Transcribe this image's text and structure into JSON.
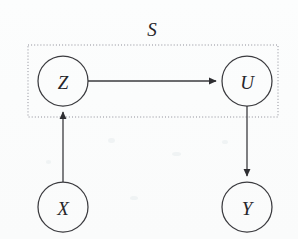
{
  "figure": {
    "type": "directed-acyclic-graph",
    "background_color": "#fdfdfd",
    "stroke_color": "#3b3b3f",
    "plate_stroke_color": "#8d8d97"
  },
  "plate": {
    "label": "S",
    "label_style": "script-italic",
    "x": 28,
    "y": 45,
    "width": 250,
    "height": 72,
    "label_x": 152,
    "label_y": 29
  },
  "nodes": [
    {
      "id": "Z",
      "label": "Z",
      "cx": 63,
      "cy": 81,
      "r": 25
    },
    {
      "id": "U",
      "label": "U",
      "cx": 247,
      "cy": 81,
      "r": 25
    },
    {
      "id": "X",
      "label": "X",
      "cx": 63,
      "cy": 207,
      "r": 25
    },
    {
      "id": "Y",
      "label": "Y",
      "cx": 247,
      "cy": 207,
      "r": 25
    }
  ],
  "edges": [
    {
      "id": "Z-to-U",
      "from": "Z",
      "to": "U",
      "direction": "right",
      "x1": 88,
      "y1": 81,
      "x2": 222,
      "y2": 81
    },
    {
      "id": "X-to-Z",
      "from": "X",
      "to": "Z",
      "direction": "up",
      "x1": 63,
      "y1": 182,
      "x2": 63,
      "y2": 106
    },
    {
      "id": "U-to-Y",
      "from": "U",
      "to": "Y",
      "direction": "down",
      "x1": 247,
      "y1": 106,
      "x2": 247,
      "y2": 182
    }
  ]
}
